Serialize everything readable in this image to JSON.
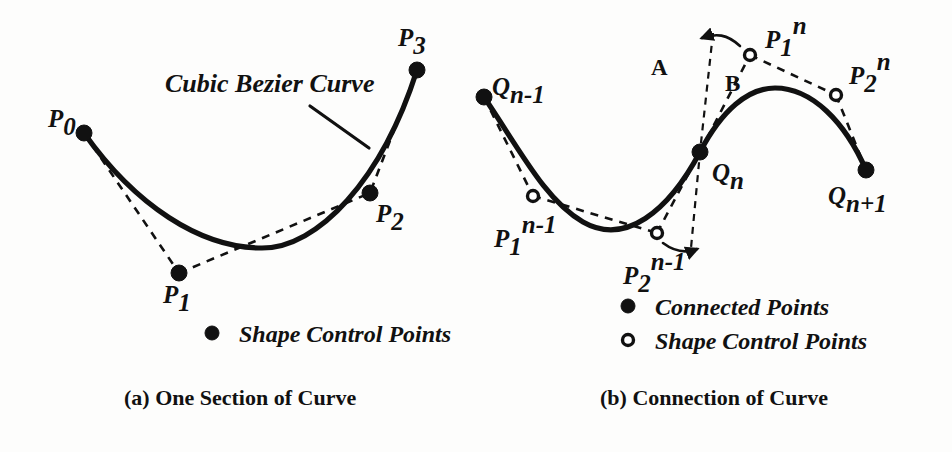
{
  "figure": {
    "background_color": "#fdfdfc",
    "ink_color": "#111111"
  },
  "panel_a": {
    "caption": "(a) One Section of Curve",
    "annotation": "Cubic Bezier Curve",
    "legend": [
      {
        "marker": "filled-dot",
        "label": "Shape Control Points"
      }
    ],
    "points": [
      {
        "id": "P0",
        "base": "P",
        "sub": "0",
        "sup": "",
        "marker": "filled-dot",
        "x": 84,
        "y": 133,
        "label_x": 48,
        "label_y": 127
      },
      {
        "id": "P1",
        "base": "P",
        "sub": "1",
        "sup": "",
        "marker": "filled-dot",
        "x": 179,
        "y": 273,
        "label_x": 163,
        "label_y": 303
      },
      {
        "id": "P2",
        "base": "P",
        "sub": "2",
        "sup": "",
        "marker": "filled-dot",
        "x": 370,
        "y": 193,
        "label_x": 376,
        "label_y": 222
      },
      {
        "id": "P3",
        "base": "P",
        "sub": "3",
        "sup": "",
        "marker": "filled-dot",
        "x": 417,
        "y": 70,
        "label_x": 398,
        "label_y": 46
      }
    ]
  },
  "panel_b": {
    "caption": "(b) Connection of Curve",
    "legend": [
      {
        "marker": "filled-dot",
        "label": "Connected Points"
      },
      {
        "marker": "open-dot",
        "label": "Shape Control Points"
      }
    ],
    "tangent_labels": [
      {
        "id": "A",
        "text": "A",
        "x": 651,
        "y": 75
      },
      {
        "id": "B",
        "text": "B",
        "x": 725,
        "y": 91
      }
    ],
    "points": [
      {
        "id": "Qn-1",
        "base": "Q",
        "sub": "n-1",
        "sup": "",
        "marker": "filled-dot",
        "x": 484,
        "y": 97,
        "label_x": 492,
        "label_y": 95
      },
      {
        "id": "P1n-1",
        "base": "P",
        "sub": "1",
        "sup": "n-1",
        "marker": "open-dot",
        "x": 533,
        "y": 196,
        "label_x": 494,
        "label_y": 240
      },
      {
        "id": "P2n-1",
        "base": "P",
        "sub": "2",
        "sup": "n-1",
        "marker": "open-dot",
        "x": 657,
        "y": 233,
        "label_x": 623,
        "label_y": 277
      },
      {
        "id": "Qn",
        "base": "Q",
        "sub": "n",
        "sup": "",
        "marker": "filled-dot",
        "x": 700,
        "y": 152,
        "label_x": 712,
        "label_y": 175
      },
      {
        "id": "P1n",
        "base": "P",
        "sub": "1",
        "sup": "n",
        "marker": "open-dot",
        "x": 750,
        "y": 55,
        "label_x": 765,
        "label_y": 41
      },
      {
        "id": "P2n",
        "base": "P",
        "sub": "2",
        "sup": "n",
        "marker": "open-dot",
        "x": 836,
        "y": 95,
        "label_x": 849,
        "label_y": 77
      },
      {
        "id": "Qn+1",
        "base": "Q",
        "sub": "n+1",
        "sup": "",
        "marker": "filled-dot",
        "x": 866,
        "y": 170,
        "label_x": 828,
        "label_y": 204
      }
    ]
  },
  "geometry": {
    "curve_a": "M 84 133 C 135 205, 200 248, 262 248 C 318 248, 382 180, 417 70",
    "hull_a_left": "M 84 133 L 179 273",
    "hull_a_right": "M 179 273 L 370 193 L 417 70",
    "leader_a": "M 310 106 L 369 148",
    "curve_b_left": "M 484 97 C 520 150, 545 200, 583 222 C 625 246, 668 212, 700 152",
    "curve_b_right": "M 700 152 C 722 110, 748 88, 775 88 C 812 88, 845 122, 866 170",
    "hull_b_1": "M 484 97 L 533 196",
    "hull_b_2": "M 533 196 L 657 233",
    "hull_b_3": "M 657 233 L 700 152",
    "hull_b_4": "M 700 152 L 750 55",
    "hull_b_5": "M 750 55 L 836 95",
    "hull_b_6": "M 836 95 L 866 170",
    "tangent_a": "M 713 33 L 700 152 L 691 248",
    "arrow_top": "M 740 46 C 727 34, 716 33, 702 38",
    "arrow_bottom": "M 663 243 C 675 252, 687 253, 697 249"
  }
}
